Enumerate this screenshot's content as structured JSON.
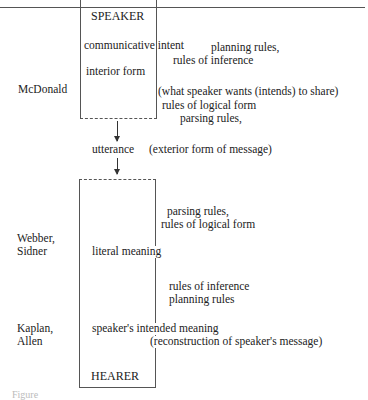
{
  "speaker_box": {
    "title": "SPEAKER",
    "items": [
      "communicative intent",
      "interior form"
    ]
  },
  "hearer_box": {
    "title": "HEARER",
    "items": [
      "literal meaning",
      "speaker's intended meaning"
    ]
  },
  "authors": {
    "speaker": "McDonald",
    "literal": [
      "Webber,",
      "Sidner"
    ],
    "intended": [
      "Kaplan,",
      "Allen"
    ]
  },
  "annotations": {
    "intent_rules": [
      "planning rules,",
      "rules of inference"
    ],
    "interior_note": "(what speaker wants (intends) to share)",
    "interior_rules": [
      "rules of logical form",
      "parsing rules,"
    ],
    "utterance": "utterance",
    "utterance_note": "(exterior form of message)",
    "hearer_rules_1": [
      "parsing rules,",
      "rules of logical form"
    ],
    "hearer_rules_2": [
      "rules of inference",
      "planning rules"
    ],
    "intended_note": "(reconstruction of speaker's message)"
  },
  "caption": "Figure"
}
